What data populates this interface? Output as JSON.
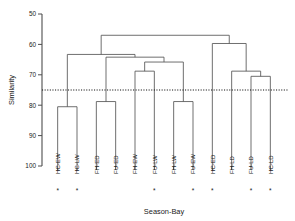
{
  "chart_data": {
    "type": "dendrogram",
    "title": "",
    "xlabel": "Season-Bay",
    "ylabel": "Similarity",
    "ylim": [
      100,
      50
    ],
    "y_ticks": [
      50,
      60,
      70,
      80,
      90,
      100
    ],
    "y_tick_labels": [
      "50",
      "60",
      "70",
      "80",
      "90",
      "100"
    ],
    "y_axis_inverted": true,
    "grid": false,
    "legend": "none",
    "leaves": [
      {
        "label": "HC-EW",
        "starred": true
      },
      {
        "label": "HC-LW",
        "starred": true
      },
      {
        "label": "FH-ED",
        "starred": false
      },
      {
        "label": "FU-ED",
        "starred": false
      },
      {
        "label": "FH-EW",
        "starred": false
      },
      {
        "label": "FU-LW",
        "starred": true
      },
      {
        "label": "FH-LW",
        "starred": false
      },
      {
        "label": "FU-EW",
        "starred": true
      },
      {
        "label": "HC-ED",
        "starred": true
      },
      {
        "label": "FH-LD",
        "starred": false
      },
      {
        "label": "FU-LD",
        "starred": true
      },
      {
        "label": "HC-LD",
        "starred": true
      }
    ],
    "merges": [
      {
        "id": "n1",
        "left": "HC-EW",
        "right": "HC-LW",
        "similarity": 80.5
      },
      {
        "id": "n2",
        "left": "FH-ED",
        "right": "FU-ED",
        "similarity": 78.8
      },
      {
        "id": "n3",
        "left": "FH-EW",
        "right": "FU-LW",
        "similarity": 68.8
      },
      {
        "id": "n4",
        "left": "FH-LW",
        "right": "FU-EW",
        "similarity": 78.8
      },
      {
        "id": "n5",
        "left": "n3",
        "right": "n4",
        "similarity": 65.8
      },
      {
        "id": "n6",
        "left": "n2",
        "right": "n5",
        "similarity": 64.2
      },
      {
        "id": "n7",
        "left": "n1",
        "right": "n6",
        "similarity": 63.3
      },
      {
        "id": "n8",
        "left": "FU-LD",
        "right": "HC-LD",
        "similarity": 70.5
      },
      {
        "id": "n9",
        "left": "FH-LD",
        "right": "n8",
        "similarity": 68.8
      },
      {
        "id": "n10",
        "left": "HC-ED",
        "right": "n9",
        "similarity": 59.7
      },
      {
        "id": "n11",
        "left": "n7",
        "right": "n10",
        "similarity": 57.0
      }
    ],
    "threshold": {
      "value": 75,
      "style": "dotted",
      "label": ""
    },
    "marker_symbol": "*",
    "marker_meaning": "starred-leaf"
  }
}
